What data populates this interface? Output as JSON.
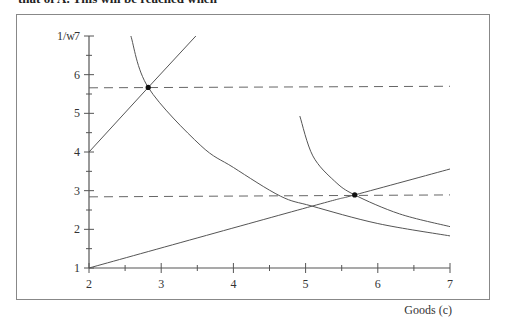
{
  "page": {
    "cut_text": "that of A. This will be reached when"
  },
  "chart_data": {
    "type": "line",
    "title": "",
    "xlabel": "Goods (c)",
    "ylabel": "1/w",
    "xlim": [
      2,
      7
    ],
    "ylim": [
      1,
      7
    ],
    "x_ticks": [
      "2",
      "3",
      "4",
      "5",
      "6",
      "7"
    ],
    "y_ticks": [
      "1",
      "2",
      "3",
      "4",
      "5",
      "6",
      "7"
    ],
    "grid": false,
    "legend": null,
    "series": [
      {
        "name": "steep line",
        "style": "solid",
        "points": [
          [
            2.0,
            4.0
          ],
          [
            2.82,
            5.67
          ],
          [
            3.48,
            7.0
          ]
        ]
      },
      {
        "name": "shallow line",
        "style": "solid",
        "points": [
          [
            2.0,
            1.0
          ],
          [
            5.09,
            2.6
          ],
          [
            5.68,
            2.89
          ],
          [
            7.0,
            3.56
          ]
        ]
      },
      {
        "name": "lower indifference curve",
        "style": "solid",
        "points": [
          [
            2.58,
            7.0
          ],
          [
            2.82,
            5.67
          ],
          [
            3.54,
            4.18
          ],
          [
            4.0,
            3.6
          ],
          [
            4.65,
            2.86
          ],
          [
            5.09,
            2.6
          ],
          [
            6.0,
            2.15
          ],
          [
            7.0,
            1.83
          ]
        ]
      },
      {
        "name": "upper indifference curve",
        "style": "solid",
        "points": [
          [
            4.92,
            4.93
          ],
          [
            5.1,
            3.9
          ],
          [
            5.4,
            3.25
          ],
          [
            5.68,
            2.89
          ],
          [
            6.3,
            2.4
          ],
          [
            7.0,
            2.07
          ]
        ]
      },
      {
        "name": "upper dashed level",
        "style": "dashed",
        "points": [
          [
            2.0,
            5.66
          ],
          [
            7.0,
            5.7
          ]
        ]
      },
      {
        "name": "lower dashed level",
        "style": "dashed",
        "points": [
          [
            2.0,
            2.84
          ],
          [
            7.0,
            2.89
          ]
        ]
      }
    ],
    "markers": [
      {
        "label": "upper tangency point",
        "x": 2.82,
        "y": 5.67
      },
      {
        "label": "lower tangency point",
        "x": 5.68,
        "y": 2.89
      }
    ]
  }
}
